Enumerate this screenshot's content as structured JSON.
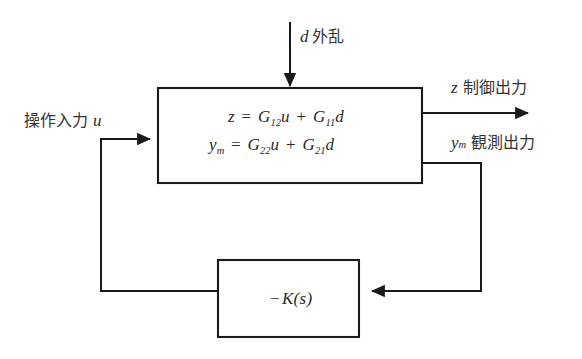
{
  "diagram": {
    "colors": {
      "line": "#1a1a1a",
      "text": "#2b2b2b",
      "background": "#ffffff"
    },
    "signals": {
      "disturbance": {
        "symbol": "d",
        "label": "外乱"
      },
      "manipulated_input": {
        "label": "操作入力",
        "symbol": "u"
      },
      "controlled_output": {
        "symbol": "z",
        "label": "制御出力"
      },
      "observed_output": {
        "symbol": "y",
        "subscript": "m",
        "label": "観測出力"
      }
    },
    "plant_block": {
      "equation_1": {
        "lhs": "z",
        "eq": "=",
        "term1_gain": "G",
        "term1_sub": "12",
        "term1_var": "u",
        "plus": "+",
        "term2_gain": "G",
        "term2_sub": "11",
        "term2_var": "d"
      },
      "equation_2": {
        "lhs": "y",
        "lhs_sub": "m",
        "eq": "=",
        "term1_gain": "G",
        "term1_sub": "22",
        "term1_var": "u",
        "plus": "+",
        "term2_gain": "G",
        "term2_sub": "21",
        "term2_var": "d"
      }
    },
    "controller_block": {
      "sign": "−",
      "symbol": "K",
      "argument": "(s)"
    }
  }
}
